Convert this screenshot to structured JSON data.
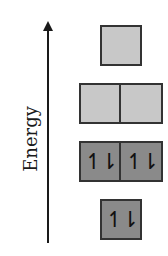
{
  "axis": {
    "label": "Energy",
    "direction": "up",
    "arrow_icon": "arrow-up-icon"
  },
  "levels": [
    {
      "name": "top",
      "orbitals": [
        {
          "electrons": ""
        }
      ],
      "fill_color": "#c8c8c8"
    },
    {
      "name": "upper-middle",
      "orbitals": [
        {
          "electrons": ""
        },
        {
          "electrons": ""
        }
      ],
      "fill_color": "#c8c8c8"
    },
    {
      "name": "lower-middle",
      "orbitals": [
        {
          "electrons": "↿⇂"
        },
        {
          "electrons": "↿⇂"
        }
      ],
      "fill_color": "#8a8a8a"
    },
    {
      "name": "bottom",
      "orbitals": [
        {
          "electrons": "↿⇂"
        }
      ],
      "fill_color": "#8a8a8a"
    }
  ],
  "colors": {
    "empty_box": "#c8c8c8",
    "filled_box": "#8a8a8a",
    "border": "#333333",
    "axis": "#1a1a1a"
  }
}
